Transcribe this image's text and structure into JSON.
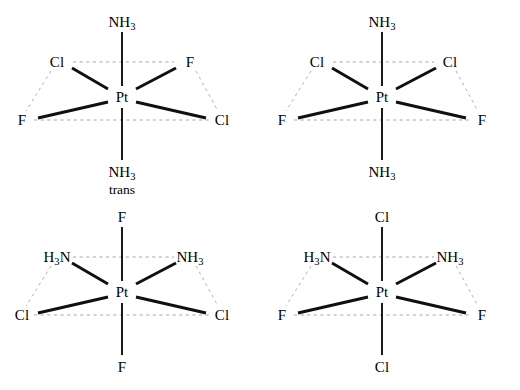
{
  "figure": {
    "metal_center": "Pt",
    "colors": {
      "bond": "#101010",
      "guide": "#a8a8a8",
      "background": "#ffffff"
    }
  },
  "structures": [
    {
      "id": "structure-1",
      "center": "Pt",
      "note": "trans",
      "axial_top": {
        "text": "NH",
        "sub": "3"
      },
      "axial_bottom": {
        "text": "NH",
        "sub": "3"
      },
      "eq_upper_left": {
        "text": "Cl",
        "sub": ""
      },
      "eq_upper_right": {
        "text": "F",
        "sub": ""
      },
      "eq_lower_left": {
        "text": "F",
        "sub": ""
      },
      "eq_lower_right": {
        "text": "Cl",
        "sub": ""
      }
    },
    {
      "id": "structure-2",
      "center": "Pt",
      "note": "",
      "axial_top": {
        "text": "NH",
        "sub": "3"
      },
      "axial_bottom": {
        "text": "NH",
        "sub": "3"
      },
      "eq_upper_left": {
        "text": "Cl",
        "sub": ""
      },
      "eq_upper_right": {
        "text": "Cl",
        "sub": ""
      },
      "eq_lower_left": {
        "text": "F",
        "sub": ""
      },
      "eq_lower_right": {
        "text": "F",
        "sub": ""
      }
    },
    {
      "id": "structure-3",
      "center": "Pt",
      "note": "",
      "axial_top": {
        "text": "F",
        "sub": ""
      },
      "axial_bottom": {
        "text": "F",
        "sub": ""
      },
      "eq_upper_left": {
        "pre": "H",
        "sub": "3",
        "post": "N"
      },
      "eq_upper_right": {
        "text": "NH",
        "sub": "3"
      },
      "eq_lower_left": {
        "text": "Cl",
        "sub": ""
      },
      "eq_lower_right": {
        "text": "Cl",
        "sub": ""
      }
    },
    {
      "id": "structure-4",
      "center": "Pt",
      "note": "",
      "axial_top": {
        "text": "Cl",
        "sub": ""
      },
      "axial_bottom": {
        "text": "Cl",
        "sub": ""
      },
      "eq_upper_left": {
        "pre": "H",
        "sub": "3",
        "post": "N"
      },
      "eq_upper_right": {
        "text": "NH",
        "sub": "3"
      },
      "eq_lower_left": {
        "text": "F",
        "sub": ""
      },
      "eq_lower_right": {
        "text": "F",
        "sub": ""
      }
    }
  ]
}
